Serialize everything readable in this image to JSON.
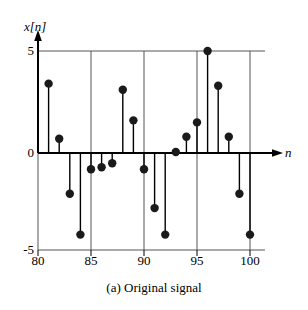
{
  "figure": {
    "caption": "(a)  Original signal",
    "ylabel": "x[n]",
    "xlabel": "n",
    "colors": {
      "ink": "#000000",
      "grid": "#555555",
      "marker": "#1a1a1a",
      "background": "#ffffff"
    }
  },
  "axes": {
    "y_ticks": [
      "5",
      "0",
      "-5"
    ],
    "x_ticks": [
      "80",
      "85",
      "90",
      "95",
      "100"
    ]
  },
  "chart_data": {
    "type": "scatter",
    "title": "(a)  Original signal",
    "xlabel": "n",
    "ylabel": "x[n]",
    "plot_style": "stem",
    "grid": "vertical gridlines at n = 80, 85, 90, 95, 100; horizontal rules at x[n] = 5 and x[n] = -5",
    "legend": "none",
    "xlim": [
      80,
      100
    ],
    "ylim": [
      -5,
      5
    ],
    "x": [
      80,
      81,
      82,
      83,
      84,
      85,
      86,
      87,
      88,
      89,
      90,
      91,
      92,
      93,
      94,
      95,
      96,
      97,
      98,
      99,
      100
    ],
    "values": [
      0,
      3.4,
      0.7,
      -2.0,
      -4.0,
      -0.8,
      -0.7,
      -0.5,
      3.1,
      1.6,
      -0.8,
      -2.7,
      -4.0,
      0.05,
      0.8,
      1.5,
      5.0,
      3.3,
      0.8,
      -2.0,
      -4.0
    ],
    "points": [
      {
        "n": 81,
        "value": 3.4
      },
      {
        "n": 82,
        "value": 0.7
      },
      {
        "n": 83,
        "value": -2.0
      },
      {
        "n": 84,
        "value": -4.0
      },
      {
        "n": 85,
        "value": -0.8
      },
      {
        "n": 86,
        "value": -0.7
      },
      {
        "n": 87,
        "value": -0.5
      },
      {
        "n": 88,
        "value": 3.1
      },
      {
        "n": 89,
        "value": 1.6
      },
      {
        "n": 90,
        "value": -0.8
      },
      {
        "n": 91,
        "value": -2.7
      },
      {
        "n": 92,
        "value": -4.0
      },
      {
        "n": 93,
        "value": 0.05
      },
      {
        "n": 94,
        "value": 0.8
      },
      {
        "n": 95,
        "value": 1.5
      },
      {
        "n": 96,
        "value": 5.0
      },
      {
        "n": 97,
        "value": 3.3
      },
      {
        "n": 98,
        "value": 0.8
      },
      {
        "n": 99,
        "value": -2.0
      },
      {
        "n": 100,
        "value": -4.0
      }
    ]
  }
}
